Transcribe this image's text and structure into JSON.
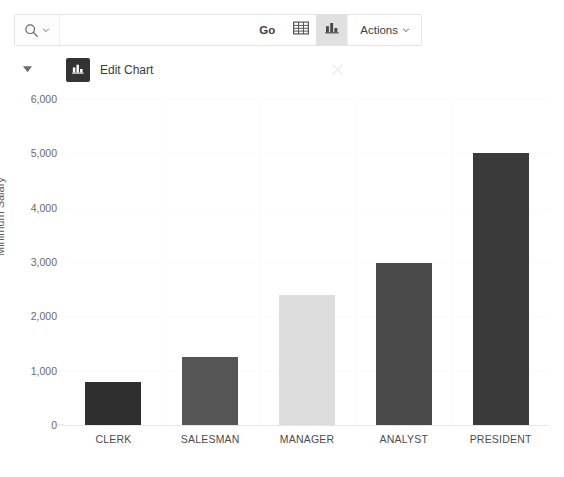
{
  "toolbar": {
    "search_icon": "search-icon",
    "search_chevron": "chevron-down-icon",
    "search_value": "",
    "search_placeholder": "",
    "go_label": "Go",
    "view_report_icon": "table-grid-icon",
    "view_chart_icon": "bar-chart-icon",
    "actions_label": "Actions",
    "actions_chevron": "chevron-down-icon"
  },
  "region": {
    "collapse_icon": "triangle-down-icon",
    "badge_icon": "bar-chart-icon",
    "title": "Edit Chart",
    "close_icon": "close-icon"
  },
  "chart_data": {
    "type": "bar",
    "title": "Edit Chart",
    "xlabel": "",
    "ylabel": "Minimum Salary",
    "categories": [
      "CLERK",
      "SALESMAN",
      "MANAGER",
      "ANALYST",
      "PRESIDENT"
    ],
    "values": [
      800,
      1250,
      2400,
      2975,
      5000
    ],
    "colors": [
      "#2f2f2f",
      "#555555",
      "#dcdcdc",
      "#4a4a4a",
      "#3a3a3a"
    ],
    "ylim": [
      0,
      6000
    ],
    "yticks": [
      0,
      1000,
      2000,
      3000,
      4000,
      5000,
      6000
    ],
    "ytick_labels": [
      "0",
      "1,000",
      "2,000",
      "3,000",
      "4,000",
      "5,000",
      "6,000"
    ],
    "grid": true,
    "legend": "none"
  }
}
